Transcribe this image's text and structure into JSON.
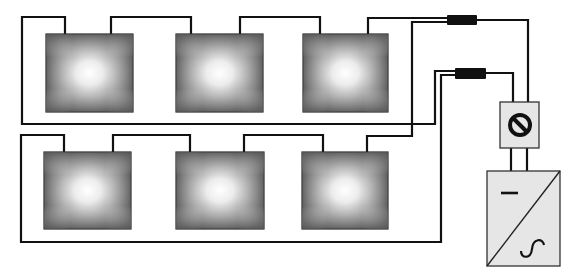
{
  "diagram": {
    "colors": {
      "wire": "#111111",
      "panel_edge": "#4d4d4d",
      "panel_center": "#ffffff",
      "panel_border": "#2a2a2a",
      "connector": "#111111",
      "device_fill": "#e6e6e6",
      "device_border": "#333333"
    },
    "panels": [
      {
        "id": "panel-1",
        "row": 1,
        "x": 46,
        "y": 34,
        "w": 87,
        "h": 78
      },
      {
        "id": "panel-2",
        "row": 1,
        "x": 176,
        "y": 34,
        "w": 87,
        "h": 78
      },
      {
        "id": "panel-3",
        "row": 1,
        "x": 303,
        "y": 34,
        "w": 85,
        "h": 78
      },
      {
        "id": "panel-4",
        "row": 2,
        "x": 44,
        "y": 152,
        "w": 87,
        "h": 77
      },
      {
        "id": "panel-5",
        "row": 2,
        "x": 176,
        "y": 152,
        "w": 88,
        "h": 77
      },
      {
        "id": "panel-6",
        "row": 2,
        "x": 302,
        "y": 152,
        "w": 86,
        "h": 77
      }
    ],
    "connectors": [
      {
        "id": "connector-1",
        "x": 447,
        "y": 15,
        "w": 30,
        "h": 10
      },
      {
        "id": "connector-2",
        "x": 455,
        "y": 68,
        "w": 31,
        "h": 11
      }
    ],
    "dc_switch": {
      "label_icon": "disconnect-symbol",
      "x": 500,
      "y": 102,
      "w": 39,
      "h": 46
    },
    "inverter": {
      "dc_symbol": "–",
      "ac_symbol": "∿",
      "x": 487,
      "y": 170,
      "w": 73,
      "h": 96
    }
  }
}
